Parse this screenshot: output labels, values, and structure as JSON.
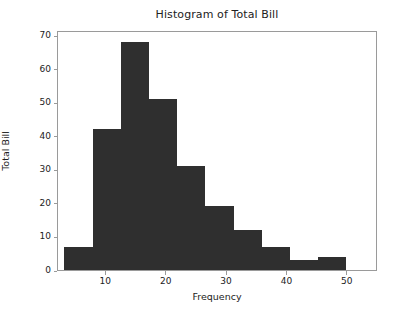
{
  "chart_data": {
    "type": "bar",
    "title": "Histogram of Total Bill",
    "xlabel": "Frequency",
    "ylabel": "Total Bill",
    "xlim": [
      2.0,
      55.0
    ],
    "ylim": [
      0,
      71.5
    ],
    "grid": false,
    "legend": null,
    "bar_color": "#2f2f2f",
    "bin_edges": [
      3.07,
      7.74,
      12.41,
      17.08,
      21.75,
      26.42,
      31.09,
      35.76,
      40.43,
      45.1,
      49.77
    ],
    "categories": [
      "3.1-7.7",
      "7.7-12.4",
      "12.4-17.1",
      "17.1-21.8",
      "21.8-26.4",
      "26.4-31.1",
      "31.1-35.8",
      "35.8-40.4",
      "40.4-45.1",
      "45.1-49.8"
    ],
    "values": [
      7,
      42,
      68,
      51,
      31,
      19,
      12,
      7,
      3,
      4
    ],
    "x_ticks": [
      10,
      20,
      30,
      40,
      50
    ],
    "x_tick_labels": [
      "10",
      "20",
      "30",
      "40",
      "50"
    ],
    "y_ticks": [
      0,
      10,
      20,
      30,
      40,
      50,
      60,
      70
    ],
    "y_tick_labels": [
      "0",
      "10",
      "20",
      "30",
      "40",
      "50",
      "60",
      "70"
    ]
  },
  "figure": {
    "background_color": "#ffffff",
    "axes_edge_color": "#9a9a9a",
    "text_color": "#222222"
  }
}
